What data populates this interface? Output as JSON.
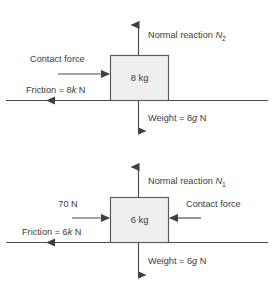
{
  "figure": {
    "background_color": "#ffffff",
    "line_color": "#4a4a4a",
    "block_fill_color": "#efefef",
    "text_color": "#3b3b3b"
  },
  "diagrams": [
    {
      "id": "upper",
      "block_label": "8 kg",
      "forces": {
        "normal": {
          "label_prefix": "Normal reaction ",
          "symbol": "N",
          "subscript": "2",
          "direction": "up"
        },
        "weight": {
          "label": "Weight = 8",
          "symbol": "g",
          "unit": " N",
          "direction": "down"
        },
        "contact": {
          "label": "Contact force",
          "direction": "right"
        },
        "friction": {
          "label_prefix": "Friction = 8",
          "symbol": "k",
          "unit": " N",
          "direction": "left"
        }
      }
    },
    {
      "id": "lower",
      "block_label": "6 kg",
      "forces": {
        "normal": {
          "label_prefix": "Normal reaction ",
          "symbol": "N",
          "subscript": "1",
          "direction": "up"
        },
        "weight": {
          "label": "Weight = 6",
          "symbol": "g",
          "unit": " N",
          "direction": "down"
        },
        "applied": {
          "label": "70 N",
          "direction": "right"
        },
        "contact": {
          "label": "Contact force",
          "direction": "left"
        },
        "friction": {
          "label_prefix": "Friction = 6",
          "symbol": "k",
          "unit": " N",
          "direction": "left"
        }
      }
    }
  ]
}
